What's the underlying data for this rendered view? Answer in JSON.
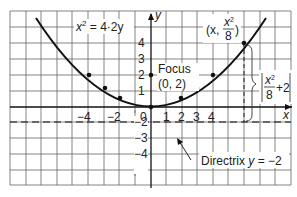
{
  "diagram": {
    "equation": {
      "lhs": "x",
      "sup": "2",
      "rhs": " = 4·2y"
    },
    "axes": {
      "x_label": "x",
      "y_label": "y",
      "x_ticks": [
        "−4",
        "−2",
        "0",
        "1",
        "2",
        "3",
        "4"
      ],
      "y_ticks_pos": [
        "4",
        "3",
        "2",
        "1"
      ],
      "y_ticks_neg": [
        "−2",
        "−3",
        "−4"
      ]
    },
    "focus": {
      "label": "Focus",
      "coords": "(0, 2)"
    },
    "point": {
      "open": "(x, ",
      "num": "x",
      "sup": "2",
      "den": "8",
      "close": ")"
    },
    "distance": {
      "num": "x",
      "sup": "2",
      "den": "8",
      "plus": "+2"
    },
    "directrix": {
      "label": "Directrix ",
      "var": "y",
      "eq": " = −2"
    },
    "colors": {
      "grid": "#555555",
      "curve": "#111111",
      "text": "#222222"
    }
  }
}
